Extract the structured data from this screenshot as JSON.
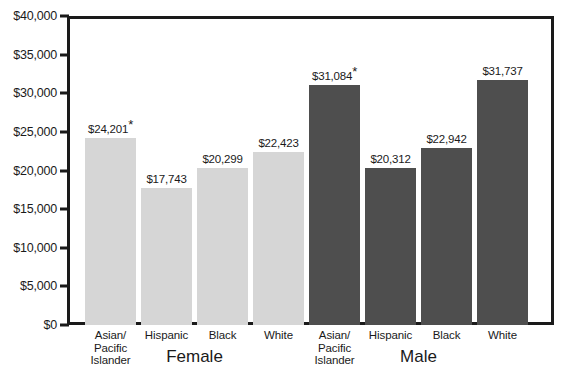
{
  "chart_data": {
    "type": "bar",
    "title": "",
    "xlabel": "",
    "ylabel": "",
    "ylim": [
      0,
      40000
    ],
    "grid": false,
    "legend": "none",
    "y_ticks": [
      "$40,000",
      "$35,000",
      "$30,000",
      "$25,000",
      "$20,000",
      "$15,000",
      "$10,000",
      "$5,000",
      "$0"
    ],
    "y_tick_values": [
      40000,
      35000,
      30000,
      25000,
      20000,
      15000,
      10000,
      5000,
      0
    ],
    "groups": [
      {
        "name": "Female",
        "label": "Female",
        "color": "#d6d6d6"
      },
      {
        "name": "Male",
        "label": "Male",
        "color": "#4e4e4e"
      }
    ],
    "categories": [
      "Asian/ Pacific Islander",
      "Hispanic",
      "Black",
      "White",
      "Asian/ Pacific Islander",
      "Hispanic",
      "Black",
      "White"
    ],
    "values": [
      24201,
      17743,
      20299,
      22423,
      31084,
      20312,
      22942,
      31737
    ],
    "bars": [
      {
        "group": "Female",
        "category_lines": [
          "Asian/",
          "Pacific",
          "Islander"
        ],
        "value": 24201,
        "label": "$24,201",
        "footnote_marker": "*",
        "shade": "light"
      },
      {
        "group": "Female",
        "category_lines": [
          "Hispanic"
        ],
        "value": 17743,
        "label": "$17,743",
        "footnote_marker": "",
        "shade": "light"
      },
      {
        "group": "Female",
        "category_lines": [
          "Black"
        ],
        "value": 20299,
        "label": "$20,299",
        "footnote_marker": "",
        "shade": "light"
      },
      {
        "group": "Female",
        "category_lines": [
          "White"
        ],
        "value": 22423,
        "label": "$22,423",
        "footnote_marker": "",
        "shade": "light"
      },
      {
        "group": "Male",
        "category_lines": [
          "Asian/",
          "Pacific",
          "Islander"
        ],
        "value": 31084,
        "label": "$31,084",
        "footnote_marker": "*",
        "shade": "dark"
      },
      {
        "group": "Male",
        "category_lines": [
          "Hispanic"
        ],
        "value": 20312,
        "label": "$20,312",
        "footnote_marker": "",
        "shade": "dark"
      },
      {
        "group": "Male",
        "category_lines": [
          "Black"
        ],
        "value": 22942,
        "label": "$22,942",
        "footnote_marker": "",
        "shade": "dark"
      },
      {
        "group": "Male",
        "category_lines": [
          "White"
        ],
        "value": 31737,
        "label": "$31,737",
        "footnote_marker": "",
        "shade": "dark"
      }
    ],
    "colors": {
      "female_bar": "#d6d6d6",
      "male_bar": "#4e4e4e",
      "axis": "#1a1a1a",
      "background": "#ffffff",
      "text": "#1a1a1a"
    }
  },
  "geometry": {
    "plot_left": 67,
    "plot_right": 554,
    "plot_top": 16,
    "baseline": 325,
    "bar_width": 51,
    "bar_step": 56,
    "first_bar_left": 85
  }
}
